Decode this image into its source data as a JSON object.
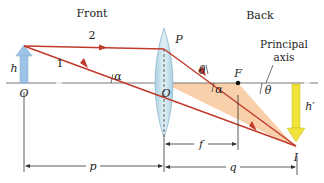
{
  "diagram": {
    "type": "thin-lens-ray-diagram",
    "regions": {
      "front": "Front",
      "back": "Back"
    },
    "labels": {
      "ray_2": "2",
      "ray_1": "1",
      "object_height": "h",
      "object_point": "O",
      "lens_center": "O",
      "lens_top_point": "P",
      "focal_point": "F",
      "image_point": "I",
      "image_height": "h′",
      "alpha_left": "α",
      "alpha_right": "α",
      "theta_left": "θ",
      "theta_right": "θ",
      "principal_axis_line1": "Principal",
      "principal_axis_line2": "axis",
      "focal_length": "f",
      "object_distance": "p",
      "image_distance": "q"
    },
    "colors": {
      "ray": "#c0392b",
      "object_arrow": "#9cc3e6",
      "image_arrow": "#f2e33a",
      "lens": "#b9dbe8",
      "triangle_fill": "#f9c89b",
      "axis": "#555555"
    }
  }
}
